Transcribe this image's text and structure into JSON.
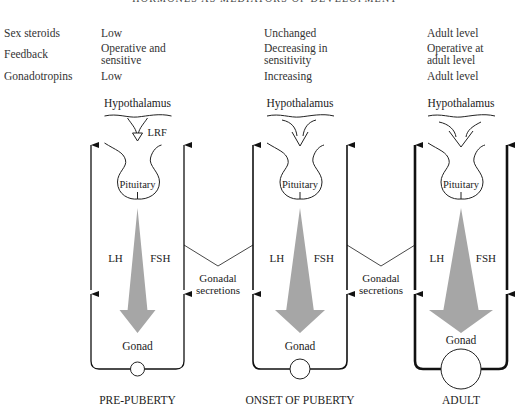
{
  "header": {
    "title": "HORMONES AS MEDIATORS OF DEVELOPMENT"
  },
  "table": {
    "row_labels": [
      "Sex steroids",
      "Feedback",
      "Gonadotropins"
    ],
    "columns": [
      {
        "stage": "PRE-PUBERTY",
        "sex_steroids": "Low",
        "feedback": "Operative and\nsensitive",
        "gonadotropins": "Low"
      },
      {
        "stage": "ONSET OF PUBERTY",
        "sex_steroids": "Unchanged",
        "feedback": "Decreasing in\nsensitivity",
        "gonadotropins": "Increasing"
      },
      {
        "stage": "ADULT",
        "sex_steroids": "Adult level",
        "feedback": "Operative at\nadult level",
        "gonadotropins": "Adult level"
      }
    ]
  },
  "diagram": {
    "labels": {
      "hypothalamus": "Hypothalamus",
      "pituitary": "Pituitary",
      "lrf": "LRF",
      "lh": "LH",
      "fsh": "FSH",
      "gonad": "Gonad",
      "gonadal_secretions_line1": "Gonadal",
      "gonadal_secretions_line2": "secretions"
    },
    "panels": [
      {
        "name": "PRE-PUBERTY",
        "left_x": 91,
        "right_x": 184,
        "gonad_radius": 7,
        "arrow_half_width": 18,
        "line_width": 1.3
      },
      {
        "name": "ONSET OF PUBERTY",
        "left_x": 253,
        "right_x": 347,
        "gonad_radius": 10,
        "arrow_half_width": 25,
        "line_width": 1.6
      },
      {
        "name": "ADULT",
        "left_x": 415,
        "right_x": 507,
        "gonad_radius": 20,
        "arrow_half_width": 32,
        "line_width": 2.6
      }
    ],
    "colors": {
      "arrow_fill": "#a6a6a6",
      "line": "#111111"
    }
  }
}
